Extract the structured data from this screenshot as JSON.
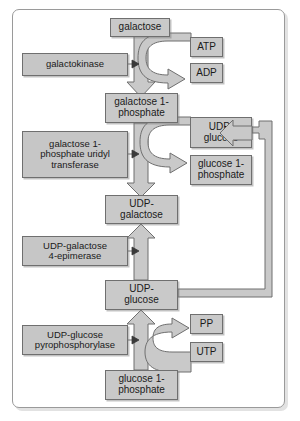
{
  "diagram": {
    "colors": {
      "node_fill": "#c9c9c9",
      "node_stroke": "#6f6f6f",
      "arrow_fill": "#c9c9c9",
      "arrow_stroke": "#6f6f6f",
      "frame_stroke": "#9a9a9a",
      "background": "#ffffff"
    },
    "metabolites": [
      {
        "id": "galactose",
        "label": "galactose"
      },
      {
        "id": "atp",
        "label": "ATP"
      },
      {
        "id": "adp",
        "label": "ADP"
      },
      {
        "id": "gal1p",
        "label": "galactose 1-\nphosphate",
        "line1": "galactose 1-",
        "line2": "phosphate"
      },
      {
        "id": "udp_glucose_right",
        "label": "UDP-\nglucose",
        "line1": "UDP-",
        "line2": "glucose"
      },
      {
        "id": "glc1p_right",
        "label": "glucose 1-\nphosphate",
        "line1": "glucose 1-",
        "line2": "phosphate"
      },
      {
        "id": "udp_galactose",
        "label": "UDP-\ngalactose",
        "line1": "UDP-",
        "line2": "galactose"
      },
      {
        "id": "udp_glucose_mid",
        "label": "UDP-\nglucose",
        "line1": "UDP-",
        "line2": "glucose"
      },
      {
        "id": "pp",
        "label": "PP"
      },
      {
        "id": "utp",
        "label": "UTP"
      },
      {
        "id": "glc1p_bottom",
        "label": "glucose 1-\nphosphate",
        "line1": "glucose 1-",
        "line2": "phosphate"
      }
    ],
    "enzymes": [
      {
        "id": "galactokinase",
        "line1": "galactokinase",
        "line2": "",
        "line3": ""
      },
      {
        "id": "gal1p_uridyl_transferase",
        "line1": "galactose 1-",
        "line2": "phosphate uridyl",
        "line3": "transferase"
      },
      {
        "id": "udp_galactose_4_epimerase",
        "line1": "UDP-galactose",
        "line2": "4-epimerase",
        "line3": ""
      },
      {
        "id": "udp_glucose_pyrophosphorylase",
        "line1": "UDP-glucose",
        "line2": "pyrophosphorylase",
        "line3": ""
      }
    ],
    "edges": [
      {
        "id": "galactose-to-gal1p",
        "from": "galactose",
        "to": "gal1p",
        "kind": "vertical-block-arrow"
      },
      {
        "id": "atp-to-adp-curve",
        "from": "atp",
        "to": "adp",
        "kind": "curved-cofactor-arrow"
      },
      {
        "id": "galactokinase-catalysis",
        "from": "galactokinase",
        "to": "galactose-to-gal1p",
        "kind": "catalysis-tick"
      },
      {
        "id": "gal1p-to-udpgal",
        "from": "gal1p",
        "to": "udp_galactose",
        "kind": "vertical-block-arrow"
      },
      {
        "id": "udpglc-to-glc1p-curve",
        "from": "udp_glucose_right",
        "to": "glc1p_right",
        "kind": "curved-cofactor-arrow"
      },
      {
        "id": "transferase-catalysis",
        "from": "gal1p_uridyl_transferase",
        "to": "gal1p-to-udpgal",
        "kind": "catalysis-tick"
      },
      {
        "id": "udpglcmid-to-udpgal",
        "from": "udp_glucose_mid",
        "to": "udp_galactose",
        "kind": "vertical-block-arrow-up"
      },
      {
        "id": "epimerase-catalysis",
        "from": "udp_galactose_4_epimerase",
        "to": "udpglcmid-to-udpgal",
        "kind": "catalysis-tick"
      },
      {
        "id": "glc1pbottom-to-udpglcmid",
        "from": "glc1p_bottom",
        "to": "udp_glucose_mid",
        "kind": "vertical-block-arrow-up"
      },
      {
        "id": "utp-to-pp-curve",
        "from": "utp",
        "to": "pp",
        "kind": "curved-cofactor-arrow"
      },
      {
        "id": "pyrophosphorylase-catalysis",
        "from": "udp_glucose_pyrophosphorylase",
        "to": "glc1pbottom-to-udpglcmid",
        "kind": "catalysis-tick"
      },
      {
        "id": "udpglcmid-feedback-to-udpglcright",
        "from": "udp_glucose_mid",
        "to": "udp_glucose_right",
        "kind": "right-loop-arrow"
      }
    ]
  }
}
